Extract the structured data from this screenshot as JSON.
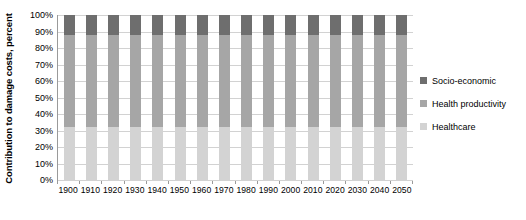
{
  "chart_data": {
    "type": "bar",
    "stacked": true,
    "normalized_percent": true,
    "title": "",
    "xlabel": "",
    "ylabel": "Contribution to damage costs, percent",
    "ylim": [
      0,
      100
    ],
    "ytick_labels": [
      "100%",
      "90%",
      "80%",
      "70%",
      "60%",
      "50%",
      "40%",
      "30%",
      "20%",
      "10%",
      "0%"
    ],
    "ytick_values": [
      100,
      90,
      80,
      70,
      60,
      50,
      40,
      30,
      20,
      10,
      0
    ],
    "grid": true,
    "legend_position": "right",
    "categories": [
      "1900",
      "1910",
      "1920",
      "1930",
      "1940",
      "1950",
      "1960",
      "1970",
      "1980",
      "1990",
      "2000",
      "2010",
      "2020",
      "2030",
      "2040",
      "2050"
    ],
    "series": [
      {
        "name": "Healthcare",
        "color": "#d3d3d3",
        "values": [
          32,
          32,
          32,
          32,
          32,
          32,
          32,
          32,
          32,
          32,
          32,
          32,
          32,
          32,
          32,
          32
        ]
      },
      {
        "name": "Health productivity",
        "color": "#a6a6a6",
        "values": [
          56,
          56,
          56,
          56,
          56,
          56,
          56,
          56,
          56,
          56,
          56,
          56,
          56,
          56,
          56,
          56
        ]
      },
      {
        "name": "Socio-economic",
        "color": "#6e6e6e",
        "values": [
          12,
          12,
          12,
          12,
          12,
          12,
          12,
          12,
          12,
          12,
          12,
          12,
          12,
          12,
          12,
          12
        ]
      }
    ]
  },
  "legend": {
    "entries": [
      {
        "label": "Socio-economic",
        "color": "#6e6e6e"
      },
      {
        "label": "Health productivity",
        "color": "#a6a6a6"
      },
      {
        "label": "Healthcare",
        "color": "#d3d3d3"
      }
    ]
  },
  "axes": {
    "y_title": "Contribution to damage costs, percent",
    "gridline_color": "#d2d2d2",
    "axis_line_color": "#9a9a9a"
  }
}
